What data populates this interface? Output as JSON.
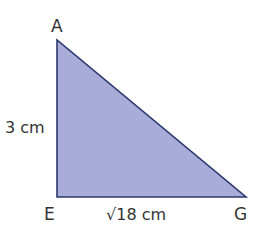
{
  "diagram": {
    "type": "right-triangle",
    "fill_color": "#a9abd8",
    "stroke_color": "#2e3a6e",
    "vertices": {
      "A": {
        "label": "A"
      },
      "E": {
        "label": "E"
      },
      "G": {
        "label": "G"
      }
    },
    "sides": {
      "AE": {
        "label": "3 cm"
      },
      "EG": {
        "label": "√18 cm"
      }
    }
  }
}
